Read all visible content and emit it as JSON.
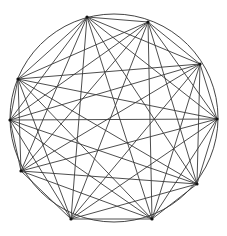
{
  "diagram": {
    "type": "complete-graph",
    "name": "K10",
    "circle": {
      "cx": 114,
      "cy": 118,
      "r": 104,
      "stroke": "#444444"
    },
    "edge_color": "#3a3a3a",
    "vertices": [
      {
        "id": 0,
        "x": 87,
        "y": 17
      },
      {
        "id": 1,
        "x": 148,
        "y": 22
      },
      {
        "id": 2,
        "x": 200,
        "y": 64
      },
      {
        "id": 3,
        "x": 217,
        "y": 119
      },
      {
        "id": 4,
        "x": 197,
        "y": 184
      },
      {
        "id": 5,
        "x": 152,
        "y": 219
      },
      {
        "id": 6,
        "x": 71,
        "y": 219
      },
      {
        "id": 7,
        "x": 21,
        "y": 171
      },
      {
        "id": 8,
        "x": 10,
        "y": 120
      },
      {
        "id": 9,
        "x": 18,
        "y": 79
      }
    ]
  },
  "caption": ""
}
